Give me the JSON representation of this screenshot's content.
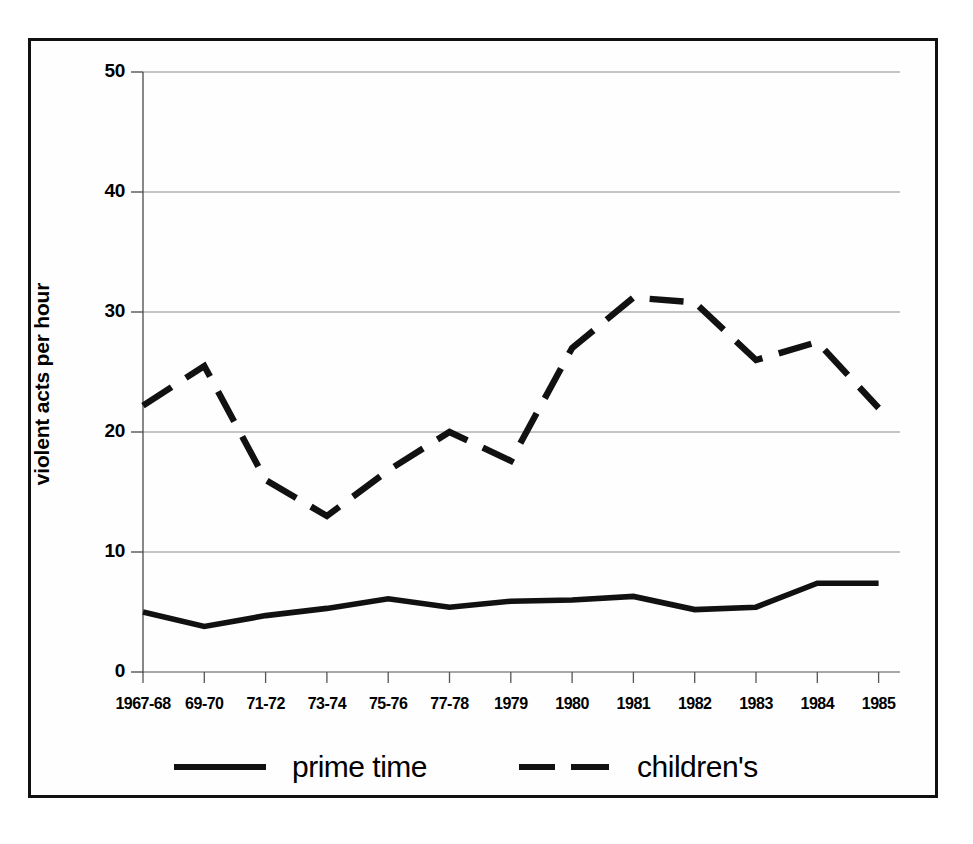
{
  "chart_data": {
    "type": "line",
    "title": "",
    "xlabel": "",
    "ylabel": "violent acts per hour",
    "categories": [
      "1967-68",
      "69-70",
      "71-72",
      "73-74",
      "75-76",
      "77-78",
      "1979",
      "1980",
      "1981",
      "1982",
      "1983",
      "1984",
      "1985"
    ],
    "ylim": [
      0,
      50
    ],
    "yticks": [
      0,
      10,
      20,
      30,
      40,
      50
    ],
    "ytick_labels": [
      "0",
      "10",
      "20",
      "30",
      "40",
      "50"
    ],
    "grid": "horizontal",
    "legend_position": "bottom",
    "series": [
      {
        "name": "prime time",
        "style": "solid",
        "color": "#111111",
        "values": [
          5.0,
          3.8,
          4.7,
          5.3,
          6.1,
          5.4,
          5.9,
          6.0,
          6.3,
          5.2,
          5.4,
          7.4,
          7.4
        ]
      },
      {
        "name": "children's",
        "style": "dashed",
        "color": "#111111",
        "values": [
          22.2,
          25.5,
          16.0,
          13.0,
          16.8,
          20.0,
          17.6,
          27.0,
          31.2,
          30.8,
          26.0,
          27.5,
          22.0
        ]
      }
    ]
  },
  "axis": {
    "y_label": "violent acts per hour",
    "y_tick_labels": [
      "50",
      "40",
      "30",
      "20",
      "10",
      "0"
    ],
    "x_tick_labels": [
      "1967-68",
      "69-70",
      "71-72",
      "73-74",
      "75-76",
      "77-78",
      "1979",
      "1980",
      "1981",
      "1982",
      "1983",
      "1984",
      "1985"
    ]
  },
  "legend": {
    "items": [
      {
        "label": "prime time",
        "style": "solid"
      },
      {
        "label": "children's",
        "style": "dashed"
      }
    ]
  },
  "colors": {
    "line": "#111111",
    "grid": "#8a8a8a",
    "axis": "#555555",
    "frame": "#111111",
    "background": "#ffffff"
  }
}
